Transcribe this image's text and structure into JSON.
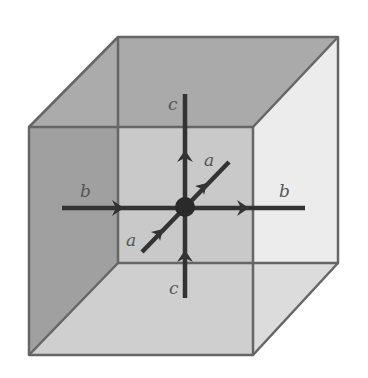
{
  "figure": {
    "colors": {
      "edge": "#666666",
      "left_face": "#ababab",
      "top_face": "#aaaaaa",
      "back_face": "#d6d6d6",
      "right_face": "#ececec",
      "bottom_face": "#dcdcdc",
      "line": "#333333",
      "vertex": "#2a2a2a",
      "label": "#555555"
    },
    "labels": {
      "b_left": "b",
      "b_right": "b",
      "c_top": "c",
      "c_bottom": "c",
      "a_upper": "a",
      "a_lower": "a"
    }
  }
}
